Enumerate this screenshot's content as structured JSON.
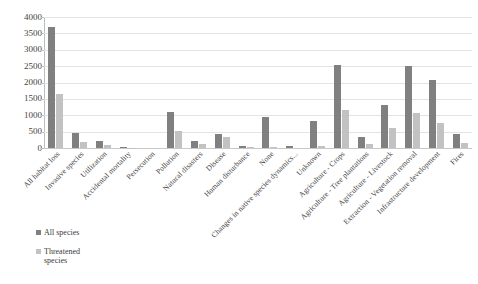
{
  "chart_data": {
    "type": "bar",
    "title": "",
    "subtitle": "",
    "xlabel": "",
    "ylabel": "",
    "ylim": [
      0,
      4000
    ],
    "ytick_step": 500,
    "yticks": [
      "4000",
      "3500",
      "3000",
      "2500",
      "2000",
      "1500",
      "1000",
      "500",
      "0"
    ],
    "grid": true,
    "legend_position": "bottom-left",
    "categories": [
      "All habitat loss",
      "Invasive species",
      "Utilization",
      "Accidental mortality",
      "Persecution",
      "Pollution",
      "Natural disasters",
      "Disease",
      "Human disturbance",
      "None",
      "Changes in native species dynamics...",
      "Unknown",
      "Agriculture - Crops",
      "Agriculture - Tree plantations",
      "Agriculture - Livestock",
      "Extraction - Vegetation removal",
      "Infrastructure development",
      "Fires"
    ],
    "series": [
      {
        "name": "All species",
        "color": "#808080",
        "values": [
          3700,
          470,
          210,
          30,
          0,
          1100,
          200,
          420,
          55,
          960,
          60,
          840,
          2550,
          340,
          1300,
          2500,
          2080,
          430
        ]
      },
      {
        "name": "Threatened species",
        "color": "#c2c2c2",
        "values": [
          1650,
          190,
          80,
          15,
          0,
          520,
          110,
          330,
          20,
          30,
          0,
          50,
          1170,
          120,
          600,
          1080,
          760,
          160
        ]
      }
    ]
  },
  "legend": {
    "items": [
      {
        "label": "All species",
        "swatch": "series-all"
      },
      {
        "label": "Threatened species",
        "swatch": "series-threat"
      }
    ]
  }
}
